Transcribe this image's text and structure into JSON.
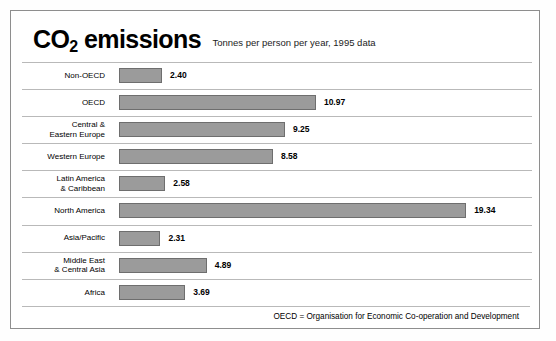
{
  "header": {
    "title_main": "CO",
    "title_sub": "2",
    "title_rest": " emissions",
    "subtitle": "Tonnes per person per year, 1995 data"
  },
  "footer": {
    "note": "OECD = Organisation for Economic Co-operation and Development"
  },
  "colors": {
    "bar_fill": "#9b9b9b",
    "bar_stroke": "#6e6e6e",
    "divider": "#b9b9b9",
    "frame": "#8e8e8e",
    "text": "#000000"
  },
  "chart_data": {
    "type": "bar",
    "orientation": "horizontal",
    "title": "CO2 emissions",
    "subtitle": "Tonnes per person per year, 1995 data",
    "xlabel": "",
    "ylabel": "",
    "xlim": [
      0,
      19.34
    ],
    "grid": false,
    "legend": null,
    "value_labels": true,
    "units": "tonnes per person per year",
    "year": 1995,
    "categories": [
      "Non-OECD",
      "OECD",
      "Central & Eastern Europe",
      "Western Europe",
      "Latin America & Caribbean",
      "North America",
      "Asia/Pacific",
      "Middle East & Central Asia",
      "Africa"
    ],
    "values": [
      2.4,
      10.97,
      9.25,
      8.58,
      2.58,
      19.34,
      2.31,
      4.89,
      3.69
    ],
    "rows": [
      {
        "label_lines": [
          "Non-OECD"
        ],
        "value": 2.4,
        "value_text": "2.40"
      },
      {
        "label_lines": [
          "OECD"
        ],
        "value": 10.97,
        "value_text": "10.97"
      },
      {
        "label_lines": [
          "Central &",
          "Eastern Europe"
        ],
        "value": 9.25,
        "value_text": "9.25"
      },
      {
        "label_lines": [
          "Western Europe"
        ],
        "value": 8.58,
        "value_text": "8.58"
      },
      {
        "label_lines": [
          "Latin America",
          "& Caribbean"
        ],
        "value": 2.58,
        "value_text": "2.58"
      },
      {
        "label_lines": [
          "North America"
        ],
        "value": 19.34,
        "value_text": "19.34"
      },
      {
        "label_lines": [
          "Asia/Pacific"
        ],
        "value": 2.31,
        "value_text": "2.31"
      },
      {
        "label_lines": [
          "Middle East",
          "& Central Asia"
        ],
        "value": 4.89,
        "value_text": "4.89"
      },
      {
        "label_lines": [
          "Africa"
        ],
        "value": 3.69,
        "value_text": "3.69"
      }
    ],
    "annotations": [
      "OECD = Organisation for Economic Co-operation and Development"
    ]
  }
}
